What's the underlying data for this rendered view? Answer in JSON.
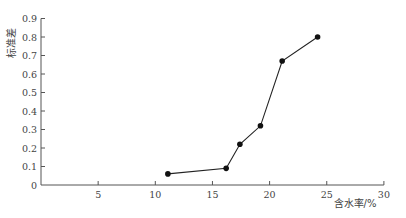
{
  "chart_data": {
    "type": "line",
    "title": "",
    "xlabel": "含水率/%",
    "ylabel": "标准差",
    "xlim": [
      0,
      30
    ],
    "ylim": [
      0,
      0.9
    ],
    "xticks": [
      0,
      5,
      10,
      15,
      20,
      25,
      30
    ],
    "yticks": [
      0,
      0.1,
      0.2,
      0.3,
      0.4,
      0.5,
      0.6,
      0.7,
      0.8,
      0.9
    ],
    "xtick_labels": [
      "",
      "5",
      "10",
      "15",
      "20",
      "25",
      "30"
    ],
    "ytick_labels": [
      "0",
      "0.1",
      "0.2",
      "0.3",
      "0.4",
      "0.5",
      "0.6",
      "0.7",
      "0.8",
      "0.9"
    ],
    "grid": false,
    "legend": null,
    "series": [
      {
        "name": "标准差",
        "marker": "filled-circle",
        "color": "#111111",
        "x": [
          11.1,
          16.2,
          17.4,
          19.2,
          21.1,
          24.2
        ],
        "y": [
          0.06,
          0.09,
          0.22,
          0.32,
          0.67,
          0.8
        ]
      }
    ]
  },
  "layout": {
    "origin_x": 41,
    "origin_y": 185,
    "px_per_x": 11.43,
    "px_per_y": 185.0,
    "axis_color": "#555555",
    "line_color": "#222222"
  }
}
